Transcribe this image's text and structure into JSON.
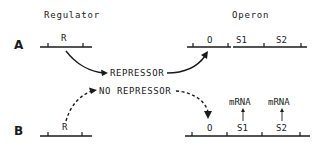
{
  "headings": {
    "regulator": "Regulator",
    "operon": "Operon"
  },
  "rows": {
    "a": {
      "label": "A",
      "regulator_gene": "R",
      "operon_genes": [
        "O",
        "S1",
        "S2"
      ],
      "message": "REPRESSOR"
    },
    "b": {
      "label": "B",
      "regulator_gene": "R",
      "operon_genes": [
        "O",
        "S1",
        "S2"
      ],
      "message": "NO REPRESSOR",
      "products": [
        "mRNA",
        "mRNA"
      ]
    }
  },
  "colors": {
    "ink": "#1a1a1a",
    "background": "#ffffff"
  }
}
